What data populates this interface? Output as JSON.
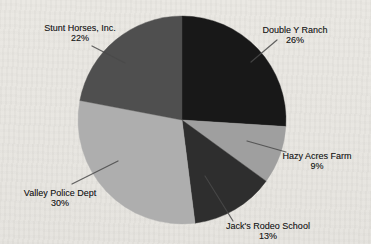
{
  "canvas": {
    "background_color": "#e8e6e1",
    "text_color": "#1e1e1e",
    "leader_line_color": "#4a4a4a"
  },
  "chart_data": {
    "type": "pie",
    "title": "",
    "unit": "%",
    "direction": "clockwise",
    "start_angle_deg": 0,
    "legend_position": "none",
    "labels_style": "outside-with-leader-lines",
    "pie": {
      "cx": 182,
      "cy": 120,
      "r": 104
    },
    "slices": [
      {
        "label": "Double Y Ranch",
        "value": 26,
        "pct_text": "26%",
        "color": "#181818",
        "label_pos": {
          "x": 295,
          "y": 35
        },
        "leader": [
          277,
          40,
          251,
          62
        ]
      },
      {
        "label": "Hazy Acres Farm",
        "value": 9,
        "pct_text": "9%",
        "color": "#9f9f9f",
        "label_pos": {
          "x": 317,
          "y": 161
        },
        "leader": [
          286,
          152,
          247,
          141
        ]
      },
      {
        "label": "Jack's Rodeo School",
        "value": 13,
        "pct_text": "13%",
        "color": "#2e2e2e",
        "label_pos": {
          "x": 268,
          "y": 231
        },
        "leader": [
          233,
          221,
          205,
          176
        ]
      },
      {
        "label": "Valley Police Dept",
        "value": 30,
        "pct_text": "30%",
        "color": "#aeaeae",
        "label_pos": {
          "x": 60,
          "y": 198
        },
        "leader": [
          72,
          184,
          118,
          161
        ]
      },
      {
        "label": "Stunt Horses, Inc.",
        "value": 22,
        "pct_text": "22%",
        "color": "#4f4f4f",
        "label_pos": {
          "x": 80,
          "y": 33
        },
        "leader": [
          92,
          46,
          125,
          63
        ]
      }
    ]
  }
}
